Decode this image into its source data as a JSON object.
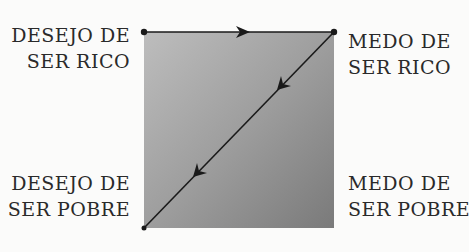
{
  "diagram": {
    "type": "transition-square",
    "colors": {
      "square_gradient_start": "#b9b9b9",
      "square_gradient_end": "#7c7c7c",
      "line": "#1a1a1a",
      "text": "#2a2a2a",
      "background": "#fbfbfa"
    },
    "corners": {
      "top_left": {
        "line1": "DESEJO DE",
        "line2": "SER RICO"
      },
      "top_right": {
        "line1": "MEDO DE",
        "line2": "SER RICO"
      },
      "bottom_left": {
        "line1": "DESEJO DE",
        "line2": "SER POBRE"
      },
      "bottom_right": {
        "line1": "MEDO DE",
        "line2": "SER POBRE"
      }
    },
    "edges": [
      {
        "from": "top_left",
        "to": "top_right",
        "arrows": 1
      },
      {
        "from": "top_right",
        "to": "bottom_left",
        "arrows": 2
      }
    ]
  }
}
